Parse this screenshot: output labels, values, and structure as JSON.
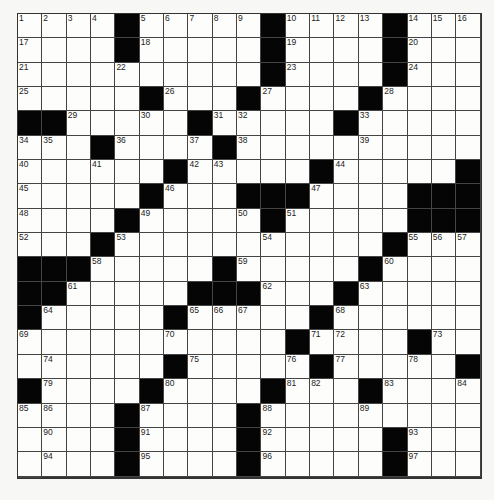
{
  "puzzle": {
    "rows": 19,
    "cols": 19,
    "grid": [
      "1 2 3 4 # 5 6 7 8 9 # 10 11 12 13 # 14 15 16",
      "17 . . . # 18 . . . . # 19 . . . # 20 . .",
      "21 . . . 22 . . . . . # 23 . . . # 24 . .",
      "25 . . . . # 26 . . # 27 . . . # 28 . . .",
      "# # 29 . . 30 . # 31 32 . . . # 33 . . . .",
      "34 35 . # 36 . . 37 # 38 . . . . 39 . . . .",
      "40 . . 41 . . # 42 43 . . . # 44 . . . . #",
      "45 . . . . # 46 . . # # # 47 . . . # # #",
      "48 . . . # 49 . . . 50 # 51 . . . . # # #",
      "52 . . # 53 . . . . . 54 . . . . # 55 56 57",
      "# # # 58 . . . . # 59 . . . . # 60 . . .",
      "# # 61 . . . . # # # 62 . . # 63 . . . .",
      "# 64 . . . . # 65 66 67 . . # 68 . . . . .",
      "69 . . . . . 70 . . . . # 71 72 . . # 73 . .",
      "74 . . . . # 75 . . . 76 # 77 . . 78 . # #",
      "79 . . . # 80 . . . # 81 82 . # 83 . . 84 85",
      "86 . . # 87 . . . # 88 . . . 89 . . . . .",
      "90 . . # 91 . . . # 92 . . . . # 93 . . .",
      "94 . . # 95 . . . # 96 . . . . # 97 . . ."
    ]
  }
}
